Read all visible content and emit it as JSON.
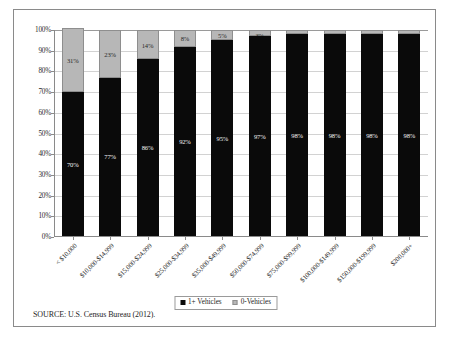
{
  "figure": {
    "source_note": "SOURCE:  U.S. Census Bureau (2012)."
  },
  "legend": {
    "items": [
      {
        "label": "1+ Vehicles",
        "color": "#0a0a0a",
        "swatch": "dark"
      },
      {
        "label": "0-Vehicles",
        "color": "#b7b7b7",
        "swatch": "light"
      }
    ]
  },
  "chart_data": {
    "type": "bar",
    "subtype": "stacked-100-percent",
    "title": "",
    "subtitle": "",
    "xlabel": "",
    "ylabel": "",
    "ylim": [
      0,
      100
    ],
    "yticks": [
      "0%",
      "10%",
      "20%",
      "30%",
      "40%",
      "50%",
      "60%",
      "70%",
      "80%",
      "90%",
      "100%"
    ],
    "ytick_values": [
      0,
      10,
      20,
      30,
      40,
      50,
      60,
      70,
      80,
      90,
      100
    ],
    "grid": true,
    "legend_position": "bottom",
    "categories": [
      "< $10,000",
      "$10,000-$14,999",
      "$15,000-$24,999",
      "$25,000-$34,999",
      "$35,000-$49,999",
      "$50,000-$74,999",
      "$75,000-$99,999",
      "$100,000-$149,999",
      "$150,000-$199,999",
      "$200,000+"
    ],
    "series": [
      {
        "name": "1+ Vehicles",
        "color": "#0a0a0a",
        "values": [
          70,
          77,
          86,
          92,
          95,
          97,
          98,
          98,
          98,
          98
        ],
        "labels": [
          "70%",
          "77%",
          "86%",
          "92%",
          "95%",
          "97%",
          "98%",
          "98%",
          "98%",
          "98%"
        ]
      },
      {
        "name": "0-Vehicles",
        "color": "#b7b7b7",
        "values": [
          31,
          23,
          14,
          8,
          5,
          3,
          2,
          2,
          2,
          2
        ],
        "labels": [
          "31%",
          "23%",
          "14%",
          "8%",
          "5%",
          "3%",
          "2%",
          "2%",
          "2%",
          "2%"
        ]
      }
    ]
  }
}
